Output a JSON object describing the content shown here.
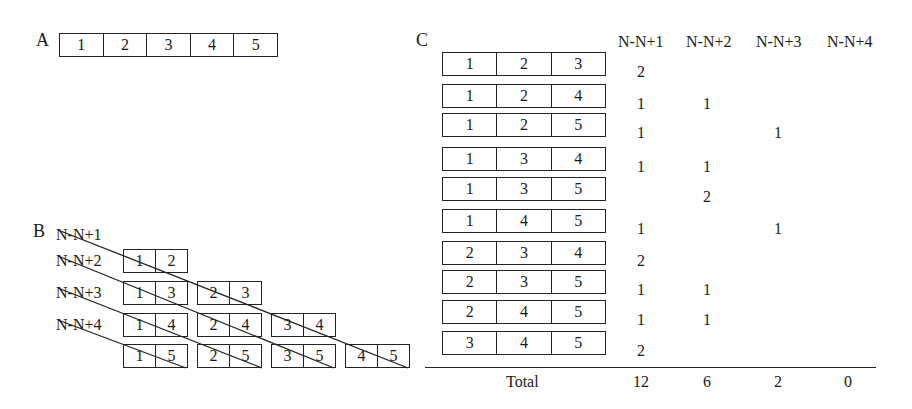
{
  "panel_a": {
    "label": "A",
    "cells": [
      "1",
      "2",
      "3",
      "4",
      "5"
    ]
  },
  "panel_b": {
    "label": "B",
    "row_labels": [
      "N-N+1",
      "N-N+2",
      "N-N+3",
      "N-N+4"
    ],
    "pairs": [
      [
        [
          "1",
          "2"
        ]
      ],
      [
        [
          "1",
          "3"
        ],
        [
          "2",
          "3"
        ]
      ],
      [
        [
          "1",
          "4"
        ],
        [
          "2",
          "4"
        ],
        [
          "3",
          "4"
        ]
      ],
      [
        [
          "1",
          "5"
        ],
        [
          "2",
          "5"
        ],
        [
          "3",
          "5"
        ],
        [
          "4",
          "5"
        ]
      ]
    ]
  },
  "panel_c": {
    "label": "C",
    "headers": [
      "N-N+1",
      "N-N+2",
      "N-N+3",
      "N-N+4"
    ],
    "rows": [
      {
        "triplet": [
          "1",
          "2",
          "3"
        ],
        "counts": [
          "2",
          "",
          "",
          ""
        ]
      },
      {
        "triplet": [
          "1",
          "2",
          "4"
        ],
        "counts": [
          "1",
          "1",
          "",
          ""
        ]
      },
      {
        "triplet": [
          "1",
          "2",
          "5"
        ],
        "counts": [
          "1",
          "",
          "1",
          ""
        ]
      },
      {
        "triplet": [
          "1",
          "3",
          "4"
        ],
        "counts": [
          "1",
          "1",
          "",
          ""
        ]
      },
      {
        "triplet": [
          "1",
          "3",
          "5"
        ],
        "counts": [
          "",
          "2",
          "",
          ""
        ]
      },
      {
        "triplet": [
          "1",
          "4",
          "5"
        ],
        "counts": [
          "1",
          "",
          "1",
          ""
        ]
      },
      {
        "triplet": [
          "2",
          "3",
          "4"
        ],
        "counts": [
          "2",
          "",
          "",
          ""
        ]
      },
      {
        "triplet": [
          "2",
          "3",
          "5"
        ],
        "counts": [
          "1",
          "1",
          "",
          ""
        ]
      },
      {
        "triplet": [
          "2",
          "4",
          "5"
        ],
        "counts": [
          "1",
          "1",
          "",
          ""
        ]
      },
      {
        "triplet": [
          "3",
          "4",
          "5"
        ],
        "counts": [
          "2",
          "",
          "",
          ""
        ]
      }
    ],
    "total_label": "Total",
    "totals": [
      "12",
      "6",
      "2",
      "0"
    ]
  }
}
